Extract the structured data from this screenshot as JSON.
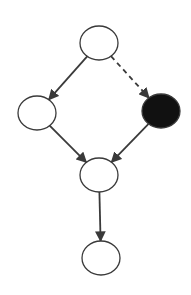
{
  "diagram": {
    "type": "directed-graph",
    "colors": {
      "stroke": "#3a3a3a",
      "node_fill": "#ffffff",
      "observed_fill": "#111111",
      "background": "#ffffff"
    },
    "nodes": [
      {
        "id": "top",
        "cx": 99,
        "cy": 43,
        "rx": 19,
        "ry": 17,
        "filled": false
      },
      {
        "id": "left",
        "cx": 37,
        "cy": 113,
        "rx": 19,
        "ry": 17,
        "filled": false
      },
      {
        "id": "right",
        "cx": 161,
        "cy": 111,
        "rx": 19,
        "ry": 17,
        "filled": true
      },
      {
        "id": "middle",
        "cx": 99,
        "cy": 175,
        "rx": 19,
        "ry": 17,
        "filled": false
      },
      {
        "id": "bottom",
        "cx": 101,
        "cy": 258,
        "rx": 19,
        "ry": 17,
        "filled": false
      }
    ],
    "edges": [
      {
        "from": "top",
        "to": "left",
        "style": "solid"
      },
      {
        "from": "top",
        "to": "right",
        "style": "dashed"
      },
      {
        "from": "left",
        "to": "middle",
        "style": "solid"
      },
      {
        "from": "right",
        "to": "middle",
        "style": "solid"
      },
      {
        "from": "middle",
        "to": "bottom",
        "style": "solid"
      }
    ]
  }
}
